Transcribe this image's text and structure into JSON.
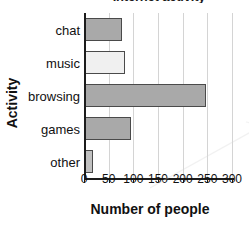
{
  "chart_data": {
    "type": "bar",
    "orientation": "horizontal",
    "title": "Internet activity",
    "xlabel": "Number of people",
    "ylabel": "Activity",
    "categories": [
      "chat",
      "music",
      "browsing",
      "games",
      "other"
    ],
    "values": [
      75,
      82,
      245,
      93,
      17
    ],
    "xlim": [
      0,
      300
    ],
    "xticks": [
      0,
      50,
      100,
      150,
      200,
      250,
      300
    ],
    "xticklabels": [
      "0",
      "50",
      "100",
      "150",
      "200",
      "250",
      "300"
    ],
    "grid": "vertical",
    "legend": "none",
    "bar_colors": [
      "#a9a9a9",
      "#f0f0f0",
      "#a9a9a9",
      "#a9a9a9",
      "#c0c0c0"
    ],
    "bar_edge_color": "#4a4a4a",
    "axis_color": "#1c1c1c",
    "gridline_color": "#d4d4d4",
    "background": "#ffffff"
  }
}
